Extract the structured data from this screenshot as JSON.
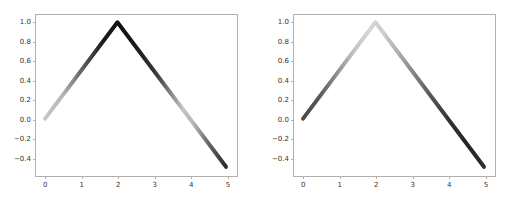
{
  "figure": {
    "background_color": "#ffffff",
    "axes_edge_color": "#b0b0b0",
    "tick_label_color": "#333333",
    "panel_count": 2
  },
  "chart_data": [
    {
      "type": "line",
      "title": "",
      "xlabel": "",
      "ylabel": "",
      "panel": "left",
      "colormap": "gray-gradient",
      "line_width_px": 4,
      "grid": false,
      "legend": null,
      "xlim": [
        -0.25,
        5.25
      ],
      "ylim": [
        -0.575,
        1.075
      ],
      "xticks": [
        "0",
        "1",
        "2",
        "3",
        "4",
        "5"
      ],
      "xtick_values": [
        0,
        1,
        2,
        3,
        4,
        5
      ],
      "yticks": [
        "1.0",
        "0.8",
        "0.6",
        "0.4",
        "0.2",
        "0.0",
        "−0.2",
        "−0.4"
      ],
      "ytick_values": [
        1.0,
        0.8,
        0.6,
        0.4,
        0.2,
        0.0,
        -0.2,
        -0.4
      ],
      "x": [
        0,
        2,
        5
      ],
      "y": [
        0.0,
        1.0,
        -0.5
      ],
      "gradient_stops": [
        {
          "offset": 0.0,
          "color": "#c8c8c8"
        },
        {
          "offset": 0.1,
          "color": "#b4b4b4"
        },
        {
          "offset": 0.22,
          "color": "#555555"
        },
        {
          "offset": 0.32,
          "color": "#1a1a1a"
        },
        {
          "offset": 0.43,
          "color": "#111111"
        },
        {
          "offset": 0.52,
          "color": "#1c1c1c"
        },
        {
          "offset": 0.62,
          "color": "#3c3c3c"
        },
        {
          "offset": 0.7,
          "color": "#8a8a8a"
        },
        {
          "offset": 0.76,
          "color": "#c4c4c4"
        },
        {
          "offset": 0.82,
          "color": "#b6b6b6"
        },
        {
          "offset": 0.9,
          "color": "#6a6a6a"
        },
        {
          "offset": 1.0,
          "color": "#2a2a2a"
        }
      ]
    },
    {
      "type": "line",
      "title": "",
      "xlabel": "",
      "ylabel": "",
      "panel": "right",
      "colormap": "gray-gradient",
      "line_width_px": 4,
      "grid": false,
      "legend": null,
      "xlim": [
        -0.25,
        5.25
      ],
      "ylim": [
        -0.575,
        1.075
      ],
      "xticks": [
        "0",
        "1",
        "2",
        "3",
        "4",
        "5"
      ],
      "xtick_values": [
        0,
        1,
        2,
        3,
        4,
        5
      ],
      "yticks": [
        "1.0",
        "0.8",
        "0.6",
        "0.4",
        "0.2",
        "0.0",
        "−0.2",
        "−0.4"
      ],
      "ytick_values": [
        1.0,
        0.8,
        0.6,
        0.4,
        0.2,
        0.0,
        -0.2,
        -0.4
      ],
      "x": [
        0,
        2,
        5
      ],
      "y": [
        0.0,
        1.0,
        -0.5
      ],
      "gradient_stops": [
        {
          "offset": 0.0,
          "color": "#4a4a4a"
        },
        {
          "offset": 0.08,
          "color": "#555555"
        },
        {
          "offset": 0.18,
          "color": "#8c8c8c"
        },
        {
          "offset": 0.28,
          "color": "#c2c2c2"
        },
        {
          "offset": 0.36,
          "color": "#d6d6d6"
        },
        {
          "offset": 0.44,
          "color": "#cdcdcd"
        },
        {
          "offset": 0.52,
          "color": "#b0b0b0"
        },
        {
          "offset": 0.6,
          "color": "#8a8a8a"
        },
        {
          "offset": 0.7,
          "color": "#5a5a5a"
        },
        {
          "offset": 0.8,
          "color": "#333333"
        },
        {
          "offset": 0.9,
          "color": "#242424"
        },
        {
          "offset": 1.0,
          "color": "#2e2e2e"
        }
      ]
    }
  ]
}
